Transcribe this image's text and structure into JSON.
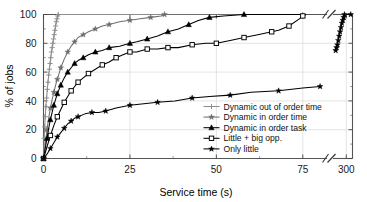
{
  "chart_data": {
    "type": "line",
    "title": "",
    "xlabel": "Service time (s)",
    "ylabel": "% of jobs",
    "ylim": [
      0,
      100
    ],
    "yticks": [
      0,
      20,
      40,
      60,
      80,
      100
    ],
    "ytick_labels": [
      "0",
      "20",
      "40",
      "60",
      "80",
      "100"
    ],
    "xticks": [
      0,
      25,
      50,
      75,
      300
    ],
    "xtick_labels": [
      "0",
      "25",
      "50",
      "75",
      "300"
    ],
    "axis_break": {
      "present": true,
      "symbol": "//",
      "after": 75,
      "before": 300
    },
    "grid": true,
    "legend_position": "lower right (inside axes)",
    "series": [
      {
        "name": "Dynamic out of order time",
        "marker": "plus",
        "color": "#8c8c8c",
        "points": [
          [
            0.0,
            0
          ],
          [
            0.2,
            14
          ],
          [
            0.35,
            22
          ],
          [
            0.5,
            29
          ],
          [
            0.7,
            36
          ],
          [
            0.9,
            42
          ],
          [
            1.1,
            48
          ],
          [
            1.3,
            53
          ],
          [
            1.5,
            58
          ],
          [
            1.7,
            62
          ],
          [
            1.9,
            66
          ],
          [
            2.1,
            70
          ],
          [
            2.3,
            74
          ],
          [
            2.5,
            77
          ],
          [
            2.7,
            80
          ],
          [
            2.9,
            83
          ],
          [
            3.1,
            86
          ],
          [
            3.3,
            89
          ],
          [
            3.5,
            92
          ],
          [
            3.7,
            95
          ],
          [
            3.9,
            97
          ],
          [
            4.1,
            99
          ],
          [
            4.3,
            100
          ],
          [
            75,
            100
          ]
        ]
      },
      {
        "name": "Dynamic in order time",
        "marker": "star",
        "color": "#6e6e6e",
        "points": [
          [
            0.0,
            0
          ],
          [
            0.5,
            10
          ],
          [
            1.0,
            20
          ],
          [
            1.5,
            28
          ],
          [
            2.0,
            35
          ],
          [
            2.5,
            41
          ],
          [
            3.0,
            46
          ],
          [
            3.5,
            51
          ],
          [
            4.0,
            55
          ],
          [
            4.5,
            59
          ],
          [
            5.0,
            63
          ],
          [
            6.0,
            69
          ],
          [
            7.0,
            74
          ],
          [
            8.0,
            78
          ],
          [
            9.0,
            81
          ],
          [
            10.0,
            84
          ],
          [
            11.5,
            86
          ],
          [
            13.0,
            88
          ],
          [
            15.0,
            90
          ],
          [
            17.0,
            92
          ],
          [
            19.0,
            93
          ],
          [
            22.0,
            95
          ],
          [
            25.0,
            96
          ],
          [
            28.0,
            97
          ],
          [
            31.0,
            98
          ],
          [
            34.0,
            99
          ],
          [
            35.0,
            100
          ],
          [
            75,
            100
          ]
        ]
      },
      {
        "name": "Dynamic in order task",
        "marker": "triangle",
        "color": "#000000",
        "points": [
          [
            0.0,
            0
          ],
          [
            0.5,
            7
          ],
          [
            1.0,
            14
          ],
          [
            1.5,
            21
          ],
          [
            2.0,
            27
          ],
          [
            2.5,
            32
          ],
          [
            3.0,
            37
          ],
          [
            3.5,
            41
          ],
          [
            4.0,
            45
          ],
          [
            4.5,
            48
          ],
          [
            5.0,
            51
          ],
          [
            6.0,
            56
          ],
          [
            7.0,
            60
          ],
          [
            8.0,
            63
          ],
          [
            9.0,
            66
          ],
          [
            10.0,
            68
          ],
          [
            11.5,
            70
          ],
          [
            13.0,
            72
          ],
          [
            15.0,
            74
          ],
          [
            17.0,
            75
          ],
          [
            19.0,
            77
          ],
          [
            22.0,
            78
          ],
          [
            25.0,
            80
          ],
          [
            27.0,
            81
          ],
          [
            30.0,
            83
          ],
          [
            33.0,
            85
          ],
          [
            36.0,
            88
          ],
          [
            39.0,
            90
          ],
          [
            42.0,
            93
          ],
          [
            45.0,
            96
          ],
          [
            48.0,
            98
          ],
          [
            52.0,
            99
          ],
          [
            58.0,
            100
          ],
          [
            75,
            100
          ]
        ]
      },
      {
        "name": "Little + big opp.",
        "marker": "open-square",
        "color": "#000000",
        "points": [
          [
            0.0,
            0
          ],
          [
            1.0,
            8
          ],
          [
            2.0,
            16
          ],
          [
            3.0,
            23
          ],
          [
            4.0,
            29
          ],
          [
            5.0,
            34
          ],
          [
            6.0,
            39
          ],
          [
            7.0,
            43
          ],
          [
            8.0,
            47
          ],
          [
            9.0,
            50
          ],
          [
            10.0,
            53
          ],
          [
            11.5,
            56
          ],
          [
            13.0,
            59
          ],
          [
            15.0,
            62
          ],
          [
            17.0,
            65
          ],
          [
            19.0,
            67
          ],
          [
            21.0,
            70
          ],
          [
            23.0,
            72
          ],
          [
            25.0,
            74
          ],
          [
            27.0,
            74
          ],
          [
            30.0,
            76
          ],
          [
            33.0,
            76
          ],
          [
            36.0,
            77
          ],
          [
            39.0,
            77
          ],
          [
            43.0,
            79
          ],
          [
            47.0,
            80
          ],
          [
            50.0,
            80
          ],
          [
            54.0,
            82
          ],
          [
            58.0,
            84
          ],
          [
            62.0,
            86
          ],
          [
            66.0,
            88
          ],
          [
            68.0,
            89
          ],
          [
            71.0,
            92
          ],
          [
            74.0,
            97
          ],
          [
            75.0,
            99
          ],
          [
            76.0,
            100
          ]
        ]
      },
      {
        "name": "Only little",
        "marker": "filled-star",
        "color": "#000000",
        "segments": [
          {
            "points": [
              [
                0.0,
                0
              ],
              [
                1.0,
                3
              ],
              [
                2.0,
                7
              ],
              [
                3.0,
                11
              ],
              [
                4.0,
                15
              ],
              [
                5.0,
                18
              ],
              [
                6.0,
                21
              ],
              [
                7.0,
                24
              ],
              [
                8.0,
                26
              ],
              [
                9.0,
                28
              ],
              [
                10.0,
                29
              ],
              [
                12.0,
                31
              ],
              [
                14.0,
                32
              ],
              [
                16.0,
                32
              ],
              [
                18.0,
                33
              ],
              [
                21.0,
                35
              ],
              [
                25.0,
                37
              ],
              [
                29.0,
                38
              ],
              [
                33.0,
                39
              ],
              [
                38.0,
                40
              ],
              [
                43.0,
                42
              ],
              [
                48.0,
                43
              ],
              [
                54.0,
                44
              ],
              [
                60.0,
                46
              ],
              [
                68.0,
                47
              ],
              [
                75.0,
                49
              ],
              [
                80.0,
                50
              ]
            ]
          },
          {
            "points": [
              [
                288.0,
                75
              ],
              [
                289.0,
                77
              ],
              [
                290.0,
                79
              ],
              [
                291.0,
                82
              ],
              [
                292.0,
                85
              ],
              [
                293.0,
                88
              ],
              [
                294.0,
                91
              ],
              [
                295.0,
                94
              ],
              [
                296.0,
                96
              ],
              [
                297.0,
                98
              ],
              [
                298.0,
                100
              ],
              [
                305.0,
                100
              ]
            ]
          }
        ]
      }
    ]
  },
  "legend": {
    "entries": [
      {
        "label": "Dynamic out of order time"
      },
      {
        "label": "Dynamic in order time"
      },
      {
        "label": "Dynamic in order task"
      },
      {
        "label": "Little + big opp."
      },
      {
        "label": "Only little"
      }
    ]
  }
}
